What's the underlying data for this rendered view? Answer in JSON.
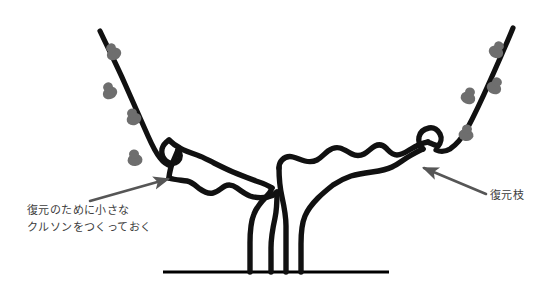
{
  "figure": {
    "width": 551,
    "height": 296,
    "background_color": "#ffffff"
  },
  "colors": {
    "branch": "#111111",
    "bud": "#6e6e6e",
    "arrow": "#565656",
    "text": "#3c3c3c",
    "ground": "#000000"
  },
  "annotations": {
    "left": {
      "line1": "復元のために小さな",
      "line2": "クルソンをつくっておく",
      "arrow_from": [
        90,
        201
      ],
      "arrow_to": [
        173,
        177
      ]
    },
    "right": {
      "line1": "復元枝",
      "arrow_from": [
        486,
        194
      ],
      "arrow_to": [
        419,
        166
      ]
    }
  },
  "drawing": {
    "ground_line": {
      "x_start": 163,
      "x_end": 389,
      "y": 272
    },
    "trunk": {
      "shape": "V-form goblet trunk",
      "base_x": 272,
      "base_y": 272
    },
    "left_arm": {
      "tip_x": 163,
      "tip_y": 176,
      "description": "wavy cordon rising to the left ending in a small hook spur"
    },
    "right_arm": {
      "tip_x": 432,
      "tip_y": 146,
      "description": "wavy cordon rising to the right ending in a small hook spur"
    },
    "left_shoot": {
      "base_x": 165,
      "base_y": 172,
      "tip_x": 100,
      "tip_y": 31,
      "bud_count": 4,
      "bud_side": "right"
    },
    "right_shoot": {
      "base_x": 437,
      "base_y": 148,
      "tip_x": 513,
      "tip_y": 28,
      "bud_count": 4,
      "bud_side": "left"
    }
  }
}
